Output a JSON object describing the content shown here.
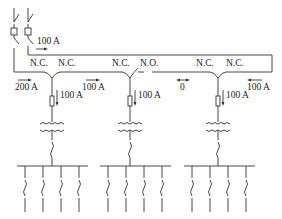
{
  "diagram": {
    "type": "ring-main-unit single-line diagram",
    "source": {
      "breaker_count": 2,
      "upper_feed_current": "100 A",
      "lower_feed_current": "200 A"
    },
    "units": [
      {
        "id": "unit-1",
        "left_switch": "N.C.",
        "right_switch": "N.C.",
        "tap_current": "100 A",
        "ring_current_right": "100 A",
        "feeders": 4
      },
      {
        "id": "unit-2",
        "left_switch": "N.C.",
        "right_switch": "N.O.",
        "tap_current": "100 A",
        "ring_current_right": "0",
        "feeders": 2
      },
      {
        "id": "unit-3",
        "left_switch": "N.C.",
        "right_switch": "N.C.",
        "tap_current": "100 A",
        "ring_current_right": "100 A",
        "feeders": 4
      }
    ],
    "labels": {
      "src_upper": "100 A",
      "ring_200": "200 A",
      "u1_left": "N.C.",
      "u1_right": "N.C.",
      "u1_tap": "100 A",
      "ring_u1_u2": "100 A",
      "u2_left": "N.C.",
      "u2_right": "N.O.",
      "u2_tap": "100 A",
      "ring_u2_u3": "0",
      "u3_left": "N.C.",
      "u3_right": "N.C.",
      "u3_tap": "100 A",
      "ring_u3_return": "100 A"
    },
    "colors": {
      "line": "#333333",
      "text": "#222222",
      "background": "#ffffff"
    }
  }
}
